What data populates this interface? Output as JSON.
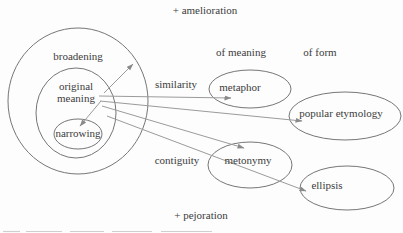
{
  "colors": {
    "background": "#fdfdfd",
    "text": "#3c3c3c",
    "ellipse_stroke": "#767676",
    "connector": "#9b9b9b"
  },
  "labels": {
    "amelioration": "+ amelioration",
    "pejoration": "+ pejoration",
    "broadening": "broadening",
    "original_line1": "original",
    "original_line2": "meaning",
    "narrowing": "narrowing",
    "similarity": "similarity",
    "contiguity": "contiguity",
    "of_meaning": "of meaning",
    "of_form": "of form",
    "metaphor": "metaphor",
    "popular_etymology": "popular etymology",
    "metonymy": "metonymy",
    "ellipsis": "ellipsis"
  },
  "diagram": {
    "type": "semantic-change-diagram",
    "axis_top": "+ amelioration",
    "axis_bottom": "+ pejoration",
    "nested_sets": [
      "broadening",
      "original meaning",
      "narrowing"
    ],
    "column_headers": [
      "of meaning",
      "of form"
    ],
    "edges": [
      {
        "from": "original meaning",
        "to": "broadening",
        "label": ""
      },
      {
        "from": "original meaning",
        "to": "narrowing",
        "label": ""
      },
      {
        "from": "original meaning",
        "to": "metaphor",
        "label": "similarity"
      },
      {
        "from": "original meaning",
        "to": "popular etymology",
        "label": ""
      },
      {
        "from": "original meaning",
        "to": "metonymy",
        "label": "contiguity"
      },
      {
        "from": "original meaning",
        "to": "ellipsis",
        "label": ""
      }
    ]
  }
}
